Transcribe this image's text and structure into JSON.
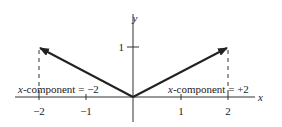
{
  "figure": {
    "axes": {
      "x_label": "x",
      "y_label": "y",
      "x_ticks": [
        {
          "value": -2,
          "label": "−2"
        },
        {
          "value": -1,
          "label": "−1"
        },
        {
          "value": 1,
          "label": "1"
        },
        {
          "value": 2,
          "label": "2"
        }
      ],
      "y_ticks": [
        {
          "value": 1,
          "label": "1"
        }
      ]
    },
    "vectors": [
      {
        "from": [
          0,
          0
        ],
        "to": [
          -2,
          1
        ],
        "annotation_var": "x",
        "annotation_text": "-component = −2"
      },
      {
        "from": [
          0,
          0
        ],
        "to": [
          2,
          1
        ],
        "annotation_var": "x",
        "annotation_text": "-component = +2"
      }
    ],
    "colors": {
      "line": "#222222",
      "background": "#ffffff"
    }
  }
}
